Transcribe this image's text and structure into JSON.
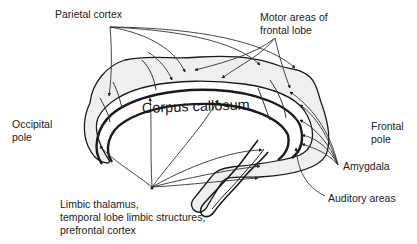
{
  "diagram": {
    "center_label": "Corpus callosum",
    "labels": {
      "parietal_cortex": "Parietal cortex",
      "motor_areas_line1": "Motor areas of",
      "motor_areas_line2": "frontal lobe",
      "occipital_pole_line1": "Occipital",
      "occipital_pole_line2": "pole",
      "frontal_pole_line1": "Frontal",
      "frontal_pole_line2": "pole",
      "amygdala": "Amygdala",
      "auditory_areas": "Auditory areas",
      "limbic_line1": "Limbic thalamus,",
      "limbic_line2": "temporal lobe limbic structures,",
      "limbic_line3": "prefrontal cortex"
    },
    "colors": {
      "outline": "#1a1a1a",
      "fill": "#f0f0f0",
      "arrow": "#333333",
      "text": "#222222"
    }
  }
}
